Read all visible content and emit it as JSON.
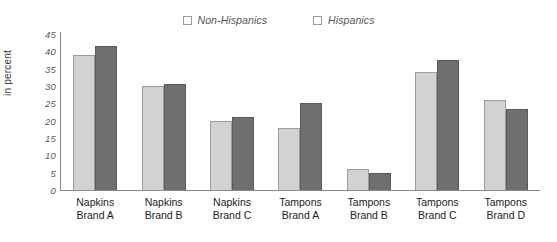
{
  "chart_data": {
    "type": "bar",
    "title": "",
    "xlabel": "",
    "ylabel": "in percent",
    "ylim": [
      0,
      45
    ],
    "yticks": [
      45,
      40,
      35,
      30,
      25,
      20,
      15,
      10,
      5,
      0
    ],
    "grid": false,
    "legend_position": "top-center",
    "categories": [
      "Napkins Brand A",
      "Napkins Brand B",
      "Napkins Brand C",
      "Tampons Brand A",
      "Tampons Brand B",
      "Tampons Brand C",
      "Tampons Brand D"
    ],
    "category_lines": [
      [
        "Napkins",
        "Brand A"
      ],
      [
        "Napkins",
        "Brand B"
      ],
      [
        "Napkins",
        "Brand C"
      ],
      [
        "Tampons",
        "Brand A"
      ],
      [
        "Tampons",
        "Brand B"
      ],
      [
        "Tampons",
        "Brand C"
      ],
      [
        "Tampons",
        "Brand D"
      ]
    ],
    "series": [
      {
        "name": "Non-Hispanics",
        "color": "#d2d2d2",
        "values": [
          39,
          30,
          20,
          18,
          6,
          34,
          26
        ]
      },
      {
        "name": "Hispanics",
        "color": "#6f6f6f",
        "values": [
          41.5,
          30.5,
          21,
          25,
          4.8,
          37.5,
          23.5
        ]
      }
    ]
  }
}
